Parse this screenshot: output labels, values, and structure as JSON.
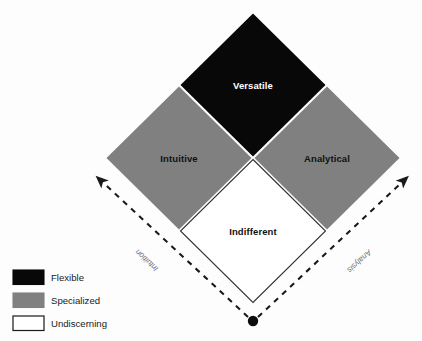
{
  "diagram": {
    "type": "quadrant-diamond-matrix",
    "quadrants": [
      {
        "id": "versatile",
        "label": "Versatile",
        "position": "top",
        "fill": "#080808",
        "text_color": "#ffffff",
        "category": "Flexible"
      },
      {
        "id": "intuitive",
        "label": "Intuitive",
        "position": "left",
        "fill": "#808080",
        "text_color": "#111111",
        "category": "Specialized"
      },
      {
        "id": "analytical",
        "label": "Analytical",
        "position": "right",
        "fill": "#808080",
        "text_color": "#111111",
        "category": "Specialized"
      },
      {
        "id": "indifferent",
        "label": "Indifferent",
        "position": "bottom",
        "fill": "#ffffff",
        "text_color": "#111111",
        "category": "Undiscerning"
      }
    ],
    "axes": [
      {
        "id": "intuition-axis",
        "label": "Intuition",
        "direction": "up-left",
        "style": "dashed-arrow",
        "color": "#1a1a1a"
      },
      {
        "id": "analysis-axis",
        "label": "Analysis",
        "direction": "up-right",
        "style": "dashed-arrow",
        "color": "#1a1a1a"
      }
    ],
    "origin_marker": {
      "id": "origin-dot",
      "shape": "circle",
      "color": "#0d0d0d"
    }
  },
  "legend": {
    "items": [
      {
        "label": "Flexible",
        "swatch_fill": "#080808",
        "swatch_stroke": "#080808"
      },
      {
        "label": "Specialized",
        "swatch_fill": "#808080",
        "swatch_stroke": "#808080"
      },
      {
        "label": "Undiscerning",
        "swatch_fill": "#ffffff",
        "swatch_stroke": "#1a1a1a"
      }
    ]
  }
}
